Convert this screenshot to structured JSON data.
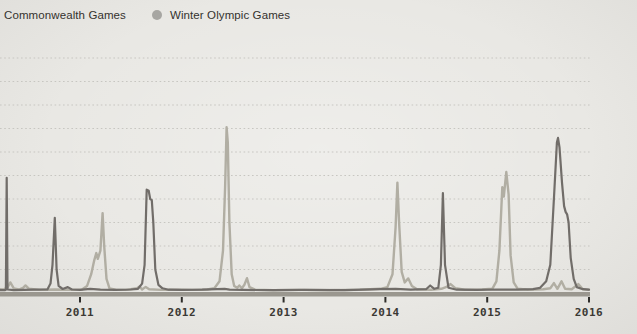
{
  "legend": {
    "items": [
      {
        "label": "Commonwealth Games",
        "marker_color": "#716d69"
      },
      {
        "label": "Winter Olympic Games",
        "marker_color": "#a7a6a2"
      }
    ]
  },
  "colors": {
    "background": "#e9e8e4",
    "gridline": "#c7c6c1",
    "axis_band": "#9a978f",
    "tick_mark": "#2e2d2a",
    "tick_text": "#3b3934"
  },
  "chart_data": {
    "type": "line",
    "title": "",
    "xlabel": "",
    "ylabel": "",
    "x_range": [
      2010.214,
      2016.01
    ],
    "y_range": [
      0,
      100
    ],
    "x_ticks": [
      "2011",
      "2012",
      "2013",
      "2014",
      "2015",
      "2016"
    ],
    "x_tick_values": [
      2011,
      2012,
      2013,
      2014,
      2015,
      2016
    ],
    "y_gridlines": [
      10,
      20,
      30,
      40,
      50,
      60,
      70,
      80,
      90,
      100
    ],
    "grid": "dotted-horizontal",
    "legend_position": "top-left",
    "series": [
      {
        "name": "Winter Olympic Games",
        "color": "#b1aea3",
        "width": 2.4,
        "points": [
          [
            2010.214,
            1.6
          ],
          [
            2010.25,
            1.5
          ],
          [
            2010.29,
            2.5
          ],
          [
            2010.315,
            4.5
          ],
          [
            2010.35,
            2
          ],
          [
            2010.4,
            1.5
          ],
          [
            2010.44,
            2.2
          ],
          [
            2010.465,
            3.2
          ],
          [
            2010.5,
            1.8
          ],
          [
            2010.6,
            1.3
          ],
          [
            2010.75,
            1.5
          ],
          [
            2010.9,
            1.4
          ],
          [
            2011.02,
            1.5
          ],
          [
            2011.07,
            3
          ],
          [
            2011.11,
            8
          ],
          [
            2011.14,
            14
          ],
          [
            2011.16,
            17
          ],
          [
            2011.175,
            14.5
          ],
          [
            2011.2,
            18
          ],
          [
            2011.222,
            34
          ],
          [
            2011.238,
            20
          ],
          [
            2011.26,
            6
          ],
          [
            2011.29,
            2
          ],
          [
            2011.35,
            1.4
          ],
          [
            2011.45,
            1.3
          ],
          [
            2011.56,
            2
          ],
          [
            2011.585,
            2.8
          ],
          [
            2011.61,
            1.5
          ],
          [
            2011.645,
            2.6
          ],
          [
            2011.68,
            1.6
          ],
          [
            2011.8,
            1.3
          ],
          [
            2011.95,
            1.4
          ],
          [
            2012.1,
            1.3
          ],
          [
            2012.25,
            1.5
          ],
          [
            2012.32,
            2
          ],
          [
            2012.37,
            5
          ],
          [
            2012.405,
            18
          ],
          [
            2012.425,
            45
          ],
          [
            2012.44,
            70.5
          ],
          [
            2012.452,
            64
          ],
          [
            2012.468,
            30
          ],
          [
            2012.49,
            8
          ],
          [
            2012.515,
            3
          ],
          [
            2012.545,
            2.2
          ],
          [
            2012.565,
            3.2
          ],
          [
            2012.59,
            2
          ],
          [
            2012.615,
            3.5
          ],
          [
            2012.64,
            6.3
          ],
          [
            2012.665,
            2.5
          ],
          [
            2012.72,
            1.4
          ],
          [
            2012.9,
            1.2
          ],
          [
            2013.15,
            1.3
          ],
          [
            2013.45,
            1.2
          ],
          [
            2013.75,
            1.4
          ],
          [
            2013.95,
            1.8
          ],
          [
            2014.02,
            2.5
          ],
          [
            2014.07,
            8
          ],
          [
            2014.1,
            28
          ],
          [
            2014.118,
            47
          ],
          [
            2014.135,
            30
          ],
          [
            2014.16,
            9
          ],
          [
            2014.19,
            4.5
          ],
          [
            2014.225,
            6.2
          ],
          [
            2014.26,
            3
          ],
          [
            2014.31,
            1.6
          ],
          [
            2014.45,
            1.4
          ],
          [
            2014.55,
            1.8
          ],
          [
            2014.6,
            2.6
          ],
          [
            2014.64,
            3.8
          ],
          [
            2014.69,
            2
          ],
          [
            2014.78,
            1.4
          ],
          [
            2014.95,
            1.5
          ],
          [
            2015.05,
            1.8
          ],
          [
            2015.09,
            5
          ],
          [
            2015.12,
            18
          ],
          [
            2015.148,
            45
          ],
          [
            2015.163,
            41
          ],
          [
            2015.188,
            51.5
          ],
          [
            2015.21,
            42
          ],
          [
            2015.23,
            16
          ],
          [
            2015.26,
            4.5
          ],
          [
            2015.3,
            1.8
          ],
          [
            2015.4,
            1.4
          ],
          [
            2015.55,
            1.6
          ],
          [
            2015.62,
            2
          ],
          [
            2015.655,
            4.2
          ],
          [
            2015.69,
            1.8
          ],
          [
            2015.73,
            5
          ],
          [
            2015.765,
            1.8
          ],
          [
            2015.83,
            1.6
          ],
          [
            2015.895,
            3.8
          ],
          [
            2015.94,
            1.6
          ],
          [
            2016.0,
            1.3
          ]
        ]
      },
      {
        "name": "Commonwealth Games",
        "color": "#716d69",
        "width": 2.2,
        "points": [
          [
            2010.214,
            1.2
          ],
          [
            2010.26,
            1.2
          ],
          [
            2010.272,
            1.5
          ],
          [
            2010.28,
            49
          ],
          [
            2010.288,
            1.5
          ],
          [
            2010.35,
            1.2
          ],
          [
            2010.55,
            1.4
          ],
          [
            2010.68,
            1.5
          ],
          [
            2010.71,
            4
          ],
          [
            2010.73,
            12
          ],
          [
            2010.752,
            32
          ],
          [
            2010.77,
            10
          ],
          [
            2010.79,
            3
          ],
          [
            2010.83,
            1.7
          ],
          [
            2010.88,
            2.5
          ],
          [
            2010.92,
            1.5
          ],
          [
            2011.0,
            1.3
          ],
          [
            2011.1,
            1.8
          ],
          [
            2011.2,
            1.4
          ],
          [
            2011.35,
            1.3
          ],
          [
            2011.5,
            1.5
          ],
          [
            2011.57,
            1.8
          ],
          [
            2011.61,
            4
          ],
          [
            2011.635,
            12
          ],
          [
            2011.655,
            44
          ],
          [
            2011.675,
            43.5
          ],
          [
            2011.69,
            40
          ],
          [
            2011.705,
            39.5
          ],
          [
            2011.72,
            30
          ],
          [
            2011.74,
            10
          ],
          [
            2011.77,
            3.5
          ],
          [
            2011.81,
            2
          ],
          [
            2011.87,
            1.4
          ],
          [
            2012.0,
            1.3
          ],
          [
            2012.2,
            1.4
          ],
          [
            2012.42,
            1.8
          ],
          [
            2012.47,
            1.4
          ],
          [
            2012.6,
            1.3
          ],
          [
            2012.9,
            1.2
          ],
          [
            2013.2,
            1.3
          ],
          [
            2013.6,
            1.2
          ],
          [
            2013.95,
            1.6
          ],
          [
            2014.1,
            1.8
          ],
          [
            2014.25,
            1.4
          ],
          [
            2014.4,
            1.6
          ],
          [
            2014.44,
            3.2
          ],
          [
            2014.48,
            1.8
          ],
          [
            2014.52,
            2.2
          ],
          [
            2014.545,
            12
          ],
          [
            2014.565,
            42.5
          ],
          [
            2014.585,
            12
          ],
          [
            2014.62,
            2.2
          ],
          [
            2014.7,
            1.4
          ],
          [
            2014.9,
            1.3
          ],
          [
            2015.1,
            1.5
          ],
          [
            2015.3,
            1.4
          ],
          [
            2015.45,
            1.6
          ],
          [
            2015.52,
            2.2
          ],
          [
            2015.58,
            5
          ],
          [
            2015.62,
            12
          ],
          [
            2015.655,
            40
          ],
          [
            2015.685,
            64
          ],
          [
            2015.695,
            66
          ],
          [
            2015.71,
            62
          ],
          [
            2015.735,
            47
          ],
          [
            2015.755,
            37
          ],
          [
            2015.77,
            34.5
          ],
          [
            2015.785,
            33.5
          ],
          [
            2015.8,
            30
          ],
          [
            2015.82,
            15
          ],
          [
            2015.85,
            6
          ],
          [
            2015.88,
            2.5
          ],
          [
            2015.94,
            1.6
          ],
          [
            2016.0,
            1.4
          ]
        ]
      }
    ]
  }
}
